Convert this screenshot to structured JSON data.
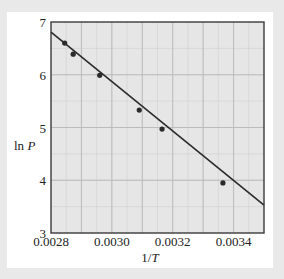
{
  "colors": {
    "background": "#e9e9e9",
    "card": "#ffffff",
    "plot_area": "#e6e6e6",
    "grid_major": "#b9b9b9",
    "grid_minor": "#d2d2d2",
    "frame": "#3a3a3a",
    "line": "#2b2b2b",
    "marker": "#2b2b2b"
  },
  "chart_data": {
    "type": "scatter",
    "title": "",
    "xlabel": "1/T",
    "ylabel": "ln P",
    "xlim": [
      0.0028,
      0.0035
    ],
    "ylim": [
      3,
      7
    ],
    "grid": true,
    "legend": null,
    "x_ticks": [
      0.0028,
      0.003,
      0.0032,
      0.0034
    ],
    "x_tick_labels": [
      "0.0028",
      "0.0030",
      "0.0032",
      "0.0034"
    ],
    "y_ticks": [
      3,
      4,
      5,
      6,
      7
    ],
    "y_tick_labels": [
      "3",
      "4",
      "5",
      "6",
      "7"
    ],
    "series": [
      {
        "name": "data",
        "kind": "points",
        "x": [
          0.002845,
          0.002873,
          0.00296,
          0.00309,
          0.003165,
          0.003365
        ],
        "y": [
          6.6,
          6.39,
          5.99,
          5.33,
          4.97,
          3.95
        ]
      },
      {
        "name": "fit",
        "kind": "line",
        "x": [
          0.0028,
          0.0035
        ],
        "y": [
          6.81,
          3.53
        ]
      }
    ]
  }
}
